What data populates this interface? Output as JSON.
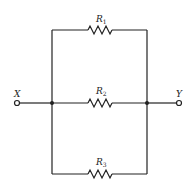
{
  "diagram": {
    "type": "parallel-resistor-circuit",
    "terminals": [
      {
        "id": "X",
        "label": "X"
      },
      {
        "id": "Y",
        "label": "Y"
      }
    ],
    "resistors": [
      {
        "name": "R",
        "sub": "1",
        "branch": "top"
      },
      {
        "name": "R",
        "sub": "2",
        "branch": "middle"
      },
      {
        "name": "R",
        "sub": "3",
        "branch": "bottom"
      }
    ],
    "colors": {
      "wire": "#222222",
      "background": "#ffffff"
    }
  }
}
